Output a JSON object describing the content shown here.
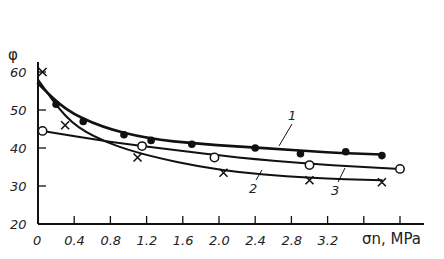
{
  "chart_data": {
    "type": "line",
    "title": "",
    "xlabel": "σn, MPa",
    "ylabel": "φ",
    "xlim": [
      0,
      4.0
    ],
    "ylim": [
      20,
      62
    ],
    "x_ticks": [
      "0",
      "0.4",
      "0.8",
      "1.2",
      "1.6",
      "2.0",
      "2.4",
      "2.8",
      "3.2"
    ],
    "y_ticks": [
      "20",
      "30",
      "40",
      "50",
      "60"
    ],
    "grid": false,
    "legend": "curve number labels 1, 2, 3 placed on curves",
    "series": [
      {
        "name": "1",
        "marker": "filled-circle",
        "x": [
          0.2,
          0.5,
          0.95,
          1.25,
          1.7,
          2.4,
          2.9,
          3.4,
          3.8
        ],
        "values": [
          51.5,
          47,
          43.5,
          42,
          41,
          40,
          38.5,
          39,
          38
        ],
        "curve": [
          [
            0,
            57
          ],
          [
            0.3,
            50
          ],
          [
            0.7,
            45.5
          ],
          [
            1.2,
            42.5
          ],
          [
            1.8,
            41
          ],
          [
            2.5,
            40
          ],
          [
            3.2,
            38.8
          ],
          [
            3.8,
            38.3
          ]
        ]
      },
      {
        "name": "2",
        "marker": "cross",
        "x": [
          0.05,
          0.3,
          1.1,
          2.05,
          3.0,
          3.8
        ],
        "values": [
          60,
          46,
          37.5,
          33.5,
          31.5,
          31
        ],
        "curve": [
          [
            0,
            58
          ],
          [
            0.3,
            48
          ],
          [
            0.6,
            43
          ],
          [
            1.1,
            38.5
          ],
          [
            2.0,
            34
          ],
          [
            3.0,
            32
          ],
          [
            3.8,
            31.5
          ]
        ]
      },
      {
        "name": "3",
        "marker": "open-circle",
        "x": [
          0.05,
          1.15,
          1.95,
          3.0,
          4.0
        ],
        "values": [
          44.5,
          40.5,
          37.5,
          35.5,
          34.5
        ],
        "curve": [
          [
            0.05,
            44.5
          ],
          [
            0.8,
            41.5
          ],
          [
            1.5,
            39.5
          ],
          [
            2.2,
            37.5
          ],
          [
            3.0,
            35.8
          ],
          [
            4.0,
            34.5
          ]
        ]
      }
    ]
  },
  "labels": {
    "y_axis_symbol": "φ",
    "x_axis_title": "σn, MPa",
    "curve_1": "1",
    "curve_2": "2",
    "curve_3": "3"
  }
}
